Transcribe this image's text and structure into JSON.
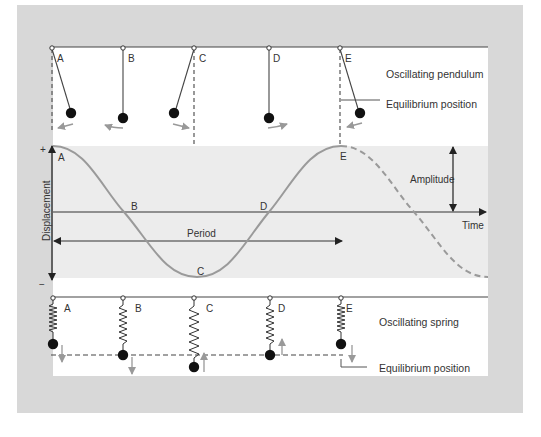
{
  "colors": {
    "frame": "#d8d8d8",
    "panel": "#ffffff",
    "wave_band": "#ececec",
    "line": "#333333",
    "curve": "#9a9a9a",
    "arrow_gray": "#999999",
    "bob": "#111111"
  },
  "pendulum": {
    "caption": "Oscillating pendulum",
    "equilibrium_label": "Equilibrium position",
    "positions": [
      {
        "label": "A",
        "state": "max-right",
        "motion": "left"
      },
      {
        "label": "B",
        "state": "equilibrium",
        "motion": "left"
      },
      {
        "label": "C",
        "state": "max-left",
        "motion": "right"
      },
      {
        "label": "D",
        "state": "equilibrium",
        "motion": "right"
      },
      {
        "label": "E",
        "state": "max-right",
        "motion": "left"
      }
    ]
  },
  "graph": {
    "y_axis_label": "Displacement",
    "y_plus": "+",
    "y_minus": "−",
    "x_axis_label": "Time",
    "period_label": "Period",
    "amplitude_label": "Amplitude",
    "points": [
      {
        "label": "A",
        "phase": "maximum"
      },
      {
        "label": "B",
        "phase": "zero-crossing"
      },
      {
        "label": "C",
        "phase": "minimum"
      },
      {
        "label": "D",
        "phase": "zero-crossing"
      },
      {
        "label": "E",
        "phase": "maximum"
      }
    ],
    "curve_solid_range": "A to E (one period)",
    "curve_dashed_range": "after E (continuation)"
  },
  "spring": {
    "caption": "Oscillating spring",
    "equilibrium_label": "Equilibrium position",
    "positions": [
      {
        "label": "A",
        "state": "compressed-top",
        "motion": "down"
      },
      {
        "label": "B",
        "state": "equilibrium",
        "motion": "down"
      },
      {
        "label": "C",
        "state": "stretched-bottom",
        "motion": "up"
      },
      {
        "label": "D",
        "state": "equilibrium",
        "motion": "up"
      },
      {
        "label": "E",
        "state": "compressed-top",
        "motion": "down"
      }
    ]
  }
}
